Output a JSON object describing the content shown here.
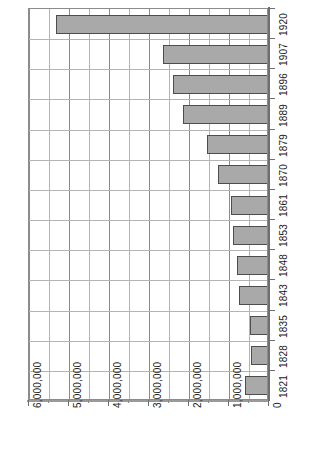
{
  "chart_data": {
    "type": "bar",
    "orientation": "horizontal-rotated",
    "title": "",
    "subtitle": "",
    "xlabel": "",
    "ylabel": "",
    "categories": [
      "1821",
      "1828",
      "1835",
      "1843",
      "1848",
      "1853",
      "1861",
      "1870",
      "1879",
      "1889",
      "1896",
      "1907",
      "1920"
    ],
    "values": [
      600000,
      450000,
      470000,
      750000,
      800000,
      900000,
      950000,
      1280000,
      1550000,
      2150000,
      2400000,
      2650000,
      5330000
    ],
    "value_axis_ticks": [
      0,
      1000000,
      2000000,
      3000000,
      4000000,
      5000000,
      6000000
    ],
    "value_axis_tick_labels": [
      "0",
      "1,000,000",
      "2,000,000",
      "3,000,000",
      "4,000,000",
      "5,000,000",
      "6,000,000"
    ],
    "minor_tick_step": 500000,
    "vlim": [
      0,
      6000000
    ],
    "grid": true,
    "legend": null,
    "legend_position": "none",
    "series": [
      {
        "name": "",
        "values": [
          600000,
          450000,
          470000,
          750000,
          800000,
          900000,
          950000,
          1280000,
          1550000,
          2150000,
          2400000,
          2650000,
          5330000
        ]
      }
    ],
    "colors": {
      "bar_fill": "#a9a9a9",
      "bar_border": "#4d4d4d",
      "grid_minor": "#b4b4b4",
      "grid_major": "#8c8c8c",
      "axis": "#6e6e6e",
      "text": "#1a1a1a",
      "background": "#ffffff"
    }
  }
}
